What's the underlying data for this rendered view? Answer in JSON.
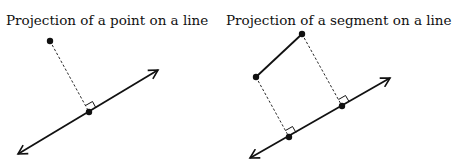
{
  "diagrams": [
    {
      "title": "Projection of a point on a line",
      "line": {
        "x1": 18,
        "y1": 154,
        "x2": 158,
        "y2": 70
      },
      "points": [
        {
          "x": 50,
          "y": 41
        }
      ],
      "feet": [
        {
          "x": 89,
          "y": 112
        }
      ]
    },
    {
      "title": "Projection of a segment on a line",
      "line": {
        "x1": 250,
        "y1": 158,
        "x2": 390,
        "y2": 78
      },
      "points": [
        {
          "x": 256,
          "y": 77
        },
        {
          "x": 302,
          "y": 34
        }
      ],
      "feet": [
        {
          "x": 289,
          "y": 137
        },
        {
          "x": 342,
          "y": 106
        }
      ]
    }
  ],
  "colors": {
    "stroke": "#111111",
    "background": "#ffffff"
  }
}
